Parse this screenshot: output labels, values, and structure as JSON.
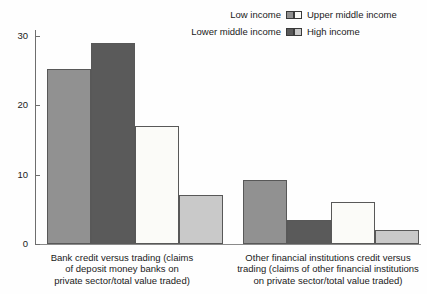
{
  "legend": {
    "entries": [
      {
        "label": "Low income",
        "color": "#919191",
        "position": "top-left"
      },
      {
        "label": "Upper middle income",
        "color": "#fbfbf8",
        "position": "top-right"
      },
      {
        "label": "Lower middle income",
        "color": "#5a5a5a",
        "position": "bottom-left"
      },
      {
        "label": "High income",
        "color": "#c9c9c9",
        "position": "bottom-right"
      }
    ]
  },
  "axis": {
    "y_ticks": [
      "0",
      "10",
      "20",
      "30"
    ]
  },
  "chart_data": {
    "type": "bar",
    "title": "",
    "subtitle": "",
    "xlabel": "",
    "ylabel": "",
    "ylim": [
      0,
      31
    ],
    "grid": false,
    "legend_position": "top-right",
    "categories": [
      "Bank credit versus trading (claims of deposit money banks on private sector/total value traded)",
      "Other financial institutions credit versus trading (claims of other financial institutions on private sector/total value traded)"
    ],
    "category_labels_wrapped": [
      "Bank credit versus trading (claims\nof deposit money banks on\nprivate sector/total value traded)",
      "Other financial institutions credit versus\ntrading (claims of other financial institutions\non private sector/total value traded)"
    ],
    "series": [
      {
        "name": "Low income",
        "color": "#919191",
        "values": [
          25.3,
          9.3
        ]
      },
      {
        "name": "Lower middle income",
        "color": "#5a5a5a",
        "values": [
          29.0,
          3.5
        ]
      },
      {
        "name": "Upper middle income",
        "color": "#fbfbf8",
        "values": [
          17.0,
          6.0
        ]
      },
      {
        "name": "High income",
        "color": "#c9c9c9",
        "values": [
          7.0,
          2.0
        ]
      }
    ]
  }
}
